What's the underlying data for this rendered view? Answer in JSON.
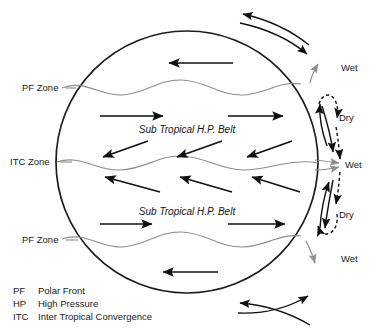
{
  "figure": {
    "title_visible": false,
    "zone_labels": [
      {
        "id": "pf-zone-north",
        "text": "PF Zone",
        "x": 22,
        "y": 91
      },
      {
        "id": "itc-zone",
        "text": "ITC Zone",
        "x": 10,
        "y": 165
      },
      {
        "id": "pf-zone-south",
        "text": "PF Zone",
        "x": 22,
        "y": 243
      }
    ],
    "belt_labels": [
      {
        "id": "belt-north",
        "text": "Sub Tropical H.P. Belt",
        "x": 187,
        "y": 133
      },
      {
        "id": "belt-south",
        "text": "Sub Tropical H.P. Belt",
        "x": 187,
        "y": 215
      }
    ],
    "moisture_labels": [
      {
        "id": "moisture-wet-1",
        "text": "Wet",
        "x": 341,
        "y": 71
      },
      {
        "id": "moisture-dry-1",
        "text": "Dry",
        "x": 339,
        "y": 121
      },
      {
        "id": "moisture-wet-2",
        "text": "Wet",
        "x": 345,
        "y": 168
      },
      {
        "id": "moisture-dry-2",
        "text": "Dry",
        "x": 339,
        "y": 218
      },
      {
        "id": "moisture-wet-3",
        "text": "Wet",
        "x": 341,
        "y": 262
      }
    ],
    "colors": {
      "outline": "#1c1c1c",
      "zone_line": "#8d8d8d",
      "arrow": "#101010",
      "background": "#ffffff"
    }
  },
  "legend": {
    "rows": [
      {
        "abbr": "PF",
        "meaning": "Polar Front"
      },
      {
        "abbr": "HP",
        "meaning": "High Pressure"
      },
      {
        "abbr": "ITC",
        "meaning": "Inter Tropical Convergence"
      }
    ]
  }
}
